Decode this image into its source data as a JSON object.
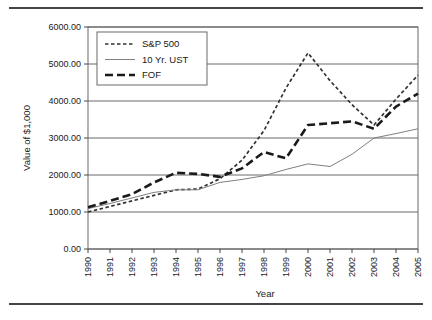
{
  "figure": {
    "top_rule": "",
    "bottom_rule": ""
  },
  "chart_data": {
    "type": "line",
    "title": "",
    "xlabel": "Year",
    "ylabel": "Value of $1,000",
    "x": [
      1990,
      1991,
      1992,
      1993,
      1994,
      1995,
      1996,
      1997,
      1998,
      1999,
      2000,
      2001,
      2002,
      2003,
      2004,
      2005
    ],
    "categories": [
      "1990",
      "1991",
      "1992",
      "1993",
      "1994",
      "1995",
      "1996",
      "1997",
      "1998",
      "1999",
      "2000",
      "2001",
      "2002",
      "2003",
      "2004",
      "2005"
    ],
    "xlim": [
      1990,
      2005
    ],
    "ylim": [
      0,
      6000
    ],
    "yticks": [
      0,
      1000,
      2000,
      3000,
      4000,
      5000,
      6000
    ],
    "ytick_labels": [
      "0.00",
      "1000.00",
      "2000.00",
      "3000.00",
      "4000.00",
      "5000.00",
      "6000.00"
    ],
    "grid": "horizontal",
    "legend_position": "top-left",
    "series": [
      {
        "name": "S&P 500",
        "style": "short-dash",
        "color": "#333333",
        "values": [
          1000,
          1150,
          1300,
          1450,
          1600,
          1620,
          1900,
          2400,
          3200,
          4350,
          5300,
          4550,
          3900,
          3350,
          4050,
          4700
        ]
      },
      {
        "name": "10 Yr. UST",
        "style": "thin-solid",
        "color": "#808080",
        "values": [
          1090,
          1230,
          1380,
          1530,
          1600,
          1600,
          1800,
          1880,
          1980,
          2150,
          2300,
          2230,
          2560,
          3000,
          3120,
          3250
        ]
      },
      {
        "name": "FOF",
        "style": "long-dash",
        "color": "#1a1a1a",
        "values": [
          1130,
          1300,
          1480,
          1800,
          2060,
          2030,
          1950,
          2180,
          2620,
          2450,
          3350,
          3400,
          3450,
          3250,
          3850,
          4200
        ]
      }
    ]
  }
}
